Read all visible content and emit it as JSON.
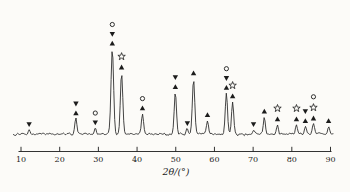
{
  "style": {
    "background": "#fcfbf8",
    "ink": "#1c1c1c",
    "trace_color": "#2f2f2f"
  },
  "chart_data": {
    "type": "line",
    "title": "",
    "xlabel": "2θ/(°)",
    "ylabel": "",
    "xlim": [
      10,
      90
    ],
    "x_ticks": [
      10,
      20,
      30,
      40,
      50,
      60,
      70,
      80,
      90
    ],
    "grid": false,
    "legend": "none",
    "y_axis_shown": false,
    "marker_glyphs": {
      "open-circle": "○",
      "open-star": "☆",
      "filled-triangle-up": "▲",
      "filled-triangle-down": "▼"
    },
    "peaks": [
      {
        "two_theta": 12.1,
        "intensity": 5,
        "markers": [
          "filled-triangle-down"
        ]
      },
      {
        "two_theta": 24.2,
        "intensity": 18,
        "markers": [
          "filled-triangle-down",
          "filled-triangle-up"
        ]
      },
      {
        "two_theta": 29.2,
        "intensity": 7,
        "markers": [
          "open-circle",
          "filled-triangle-down"
        ]
      },
      {
        "two_theta": 33.6,
        "intensity": 100,
        "markers": [
          "open-circle",
          "filled-triangle-down",
          "filled-triangle-up"
        ]
      },
      {
        "two_theta": 36.0,
        "intensity": 72,
        "markers": [
          "open-star",
          "filled-triangle-up"
        ]
      },
      {
        "two_theta": 41.4,
        "intensity": 24,
        "markers": [
          "open-circle",
          "filled-triangle-up"
        ]
      },
      {
        "two_theta": 49.9,
        "intensity": 49,
        "markers": [
          "filled-triangle-down",
          "filled-triangle-up"
        ]
      },
      {
        "two_theta": 53.0,
        "intensity": 6,
        "markers": [
          "filled-triangle-down"
        ]
      },
      {
        "two_theta": 54.6,
        "intensity": 65,
        "markers": [
          "filled-triangle-up"
        ]
      },
      {
        "two_theta": 58.2,
        "intensity": 16,
        "markers": [
          "filled-triangle-up"
        ]
      },
      {
        "two_theta": 63.1,
        "intensity": 48,
        "markers": [
          "open-circle",
          "filled-triangle-down",
          "filled-triangle-up"
        ]
      },
      {
        "two_theta": 64.7,
        "intensity": 38,
        "markers": [
          "open-star",
          "filled-triangle-up"
        ]
      },
      {
        "two_theta": 70.1,
        "intensity": 5,
        "markers": [
          "filled-triangle-down"
        ]
      },
      {
        "two_theta": 72.9,
        "intensity": 20,
        "markers": [
          "filled-triangle-up"
        ]
      },
      {
        "two_theta": 76.3,
        "intensity": 11,
        "markers": [
          "open-star",
          "filled-triangle-up"
        ]
      },
      {
        "two_theta": 81.2,
        "intensity": 11,
        "markers": [
          "open-star",
          "filled-triangle-up"
        ]
      },
      {
        "two_theta": 83.5,
        "intensity": 9,
        "markers": [
          "filled-triangle-down",
          "filled-triangle-up"
        ]
      },
      {
        "two_theta": 85.6,
        "intensity": 12,
        "markers": [
          "open-circle",
          "open-star",
          "filled-triangle-up"
        ]
      },
      {
        "two_theta": 89.5,
        "intensity": 9,
        "markers": [
          "filled-triangle-up"
        ]
      }
    ]
  }
}
